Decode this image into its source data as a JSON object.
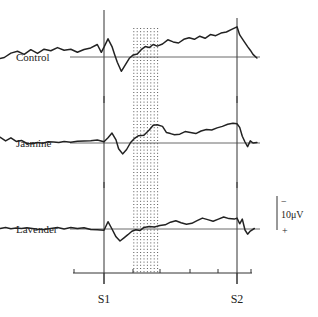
{
  "chart_data": {
    "type": "line",
    "title": "",
    "xlabel": "",
    "ylabel": "",
    "x_markers": [
      "S1",
      "S2"
    ],
    "x_tick_count": 8,
    "shaded_region": {
      "start_fraction_between_markers": 0.22,
      "end_fraction_between_markers": 0.42,
      "style": "dotted"
    },
    "scale_bar": {
      "label": "10μV",
      "top_sign": "−",
      "bottom_sign": "+"
    },
    "polarity": "negative-up",
    "x_domain": [
      -1,
      1.3
    ],
    "note": "x in units where S1=0 and S2=1; y in μV relative to baseline, positive values drawn upward (negative polarity)",
    "series": [
      {
        "name": "Control",
        "points": [
          [
            -0.9,
            -1.2
          ],
          [
            -0.85,
            -0.6
          ],
          [
            -0.8,
            -0.8
          ],
          [
            -0.75,
            -0.2
          ],
          [
            -0.7,
            1.5
          ],
          [
            -0.65,
            2.2
          ],
          [
            -0.6,
            1.0
          ],
          [
            -0.55,
            2.8
          ],
          [
            -0.5,
            1.4
          ],
          [
            -0.45,
            3.0
          ],
          [
            -0.4,
            2.4
          ],
          [
            -0.35,
            3.6
          ],
          [
            -0.3,
            2.6
          ],
          [
            -0.25,
            3.0
          ],
          [
            -0.2,
            1.8
          ],
          [
            -0.15,
            2.9
          ],
          [
            -0.1,
            3.5
          ],
          [
            -0.05,
            4.8
          ],
          [
            -0.02,
            1.8
          ],
          [
            0.0,
            3.8
          ],
          [
            0.03,
            7.0
          ],
          [
            0.06,
            4.0
          ],
          [
            0.08,
            1.0
          ],
          [
            0.1,
            -2.0
          ],
          [
            0.13,
            -5.5
          ],
          [
            0.16,
            -3.0
          ],
          [
            0.19,
            -0.5
          ],
          [
            0.22,
            0.8
          ],
          [
            0.25,
            1.2
          ],
          [
            0.28,
            2.8
          ],
          [
            0.31,
            4.0
          ],
          [
            0.34,
            3.6
          ],
          [
            0.37,
            4.8
          ],
          [
            0.4,
            4.2
          ],
          [
            0.44,
            5.0
          ],
          [
            0.48,
            6.6
          ],
          [
            0.52,
            5.8
          ],
          [
            0.56,
            5.4
          ],
          [
            0.6,
            6.8
          ],
          [
            0.64,
            7.4
          ],
          [
            0.68,
            6.8
          ],
          [
            0.72,
            8.0
          ],
          [
            0.76,
            7.2
          ],
          [
            0.8,
            8.6
          ],
          [
            0.84,
            8.2
          ],
          [
            0.88,
            9.2
          ],
          [
            0.92,
            9.6
          ],
          [
            0.96,
            10.6
          ],
          [
            1.0,
            11.6
          ],
          [
            1.02,
            8.5
          ],
          [
            1.05,
            6.2
          ],
          [
            1.08,
            4.0
          ],
          [
            1.1,
            2.6
          ],
          [
            1.12,
            1.0
          ],
          [
            1.15,
            -0.4
          ]
        ]
      },
      {
        "name": "Jasmine",
        "points": [
          [
            -0.9,
            0.2
          ],
          [
            -0.86,
            1.8
          ],
          [
            -0.82,
            1.0
          ],
          [
            -0.78,
            2.2
          ],
          [
            -0.74,
            0.8
          ],
          [
            -0.7,
            2.0
          ],
          [
            -0.66,
            0.6
          ],
          [
            -0.62,
            1.0
          ],
          [
            -0.58,
            -0.2
          ],
          [
            -0.54,
            -0.3
          ],
          [
            -0.5,
            0.2
          ],
          [
            -0.46,
            -0.1
          ],
          [
            -0.42,
            0.5
          ],
          [
            -0.38,
            0.4
          ],
          [
            -0.34,
            0.2
          ],
          [
            -0.3,
            0.6
          ],
          [
            -0.25,
            0.3
          ],
          [
            -0.2,
            0.7
          ],
          [
            -0.15,
            0.8
          ],
          [
            -0.1,
            0.9
          ],
          [
            -0.05,
            1.1
          ],
          [
            0.0,
            0.5
          ],
          [
            0.03,
            2.0
          ],
          [
            0.06,
            3.8
          ],
          [
            0.09,
            1.2
          ],
          [
            0.11,
            -2.2
          ],
          [
            0.14,
            -4.2
          ],
          [
            0.17,
            -2.5
          ],
          [
            0.2,
            0.2
          ],
          [
            0.23,
            1.8
          ],
          [
            0.26,
            2.8
          ],
          [
            0.3,
            3.0
          ],
          [
            0.34,
            5.0
          ],
          [
            0.37,
            6.8
          ],
          [
            0.4,
            7.0
          ],
          [
            0.44,
            6.4
          ],
          [
            0.47,
            4.0
          ],
          [
            0.5,
            3.6
          ],
          [
            0.53,
            3.2
          ],
          [
            0.57,
            3.4
          ],
          [
            0.61,
            4.4
          ],
          [
            0.65,
            4.0
          ],
          [
            0.69,
            3.6
          ],
          [
            0.73,
            4.6
          ],
          [
            0.77,
            5.2
          ],
          [
            0.81,
            5.0
          ],
          [
            0.85,
            5.8
          ],
          [
            0.89,
            6.4
          ],
          [
            0.93,
            7.2
          ],
          [
            0.97,
            7.6
          ],
          [
            1.0,
            7.4
          ],
          [
            1.02,
            6.0
          ],
          [
            1.04,
            2.6
          ],
          [
            1.06,
            0.4
          ],
          [
            1.08,
            -1.4
          ],
          [
            1.1,
            0.8
          ],
          [
            1.12,
            0.0
          ],
          [
            1.15,
            0.2
          ]
        ]
      },
      {
        "name": "Lavender",
        "points": [
          [
            -0.9,
            0.4
          ],
          [
            -0.86,
            0.1
          ],
          [
            -0.82,
            0.5
          ],
          [
            -0.78,
            0.2
          ],
          [
            -0.74,
            0.6
          ],
          [
            -0.7,
            0.1
          ],
          [
            -0.66,
            0.4
          ],
          [
            -0.62,
            0.2
          ],
          [
            -0.58,
            0.5
          ],
          [
            -0.54,
            0.2
          ],
          [
            -0.5,
            -0.1
          ],
          [
            -0.45,
            -0.2
          ],
          [
            -0.4,
            0.2
          ],
          [
            -0.35,
            0.6
          ],
          [
            -0.3,
            0.0
          ],
          [
            -0.25,
            0.6
          ],
          [
            -0.2,
            0.2
          ],
          [
            -0.15,
            0.5
          ],
          [
            -0.1,
            -0.2
          ],
          [
            -0.05,
            -0.3
          ],
          [
            0.0,
            -0.5
          ],
          [
            0.03,
            2.8
          ],
          [
            0.06,
            0.0
          ],
          [
            0.09,
            -3.0
          ],
          [
            0.12,
            -4.6
          ],
          [
            0.15,
            -3.4
          ],
          [
            0.18,
            -2.2
          ],
          [
            0.21,
            -0.9
          ],
          [
            0.24,
            -0.3
          ],
          [
            0.27,
            -0.6
          ],
          [
            0.3,
            0.6
          ],
          [
            0.34,
            1.0
          ],
          [
            0.38,
            0.8
          ],
          [
            0.42,
            1.3
          ],
          [
            0.46,
            1.6
          ],
          [
            0.5,
            2.6
          ],
          [
            0.54,
            3.2
          ],
          [
            0.58,
            2.4
          ],
          [
            0.62,
            1.8
          ],
          [
            0.66,
            2.2
          ],
          [
            0.7,
            3.2
          ],
          [
            0.74,
            4.2
          ],
          [
            0.78,
            3.6
          ],
          [
            0.82,
            3.0
          ],
          [
            0.86,
            3.8
          ],
          [
            0.9,
            4.6
          ],
          [
            0.94,
            4.0
          ],
          [
            0.98,
            3.8
          ],
          [
            1.0,
            4.2
          ],
          [
            1.02,
            2.0
          ],
          [
            1.04,
            3.8
          ],
          [
            1.06,
            -0.4
          ],
          [
            1.08,
            -2.0
          ],
          [
            1.1,
            -0.8
          ],
          [
            1.13,
            0.2
          ]
        ]
      }
    ]
  }
}
